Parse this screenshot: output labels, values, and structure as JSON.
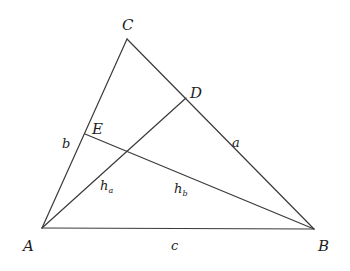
{
  "diagram": {
    "type": "triangle-altitudes",
    "points": {
      "A": {
        "label": "A",
        "x": 42,
        "y": 228
      },
      "B": {
        "label": "B",
        "x": 314,
        "y": 229
      },
      "C": {
        "label": "C",
        "x": 127,
        "y": 39
      },
      "D": {
        "label": "D",
        "x": 186,
        "y": 98
      },
      "E": {
        "label": "E",
        "x": 85,
        "y": 134
      }
    },
    "segments": [
      {
        "from": "A",
        "to": "B",
        "name": "side-c"
      },
      {
        "from": "B",
        "to": "C",
        "name": "side-a"
      },
      {
        "from": "C",
        "to": "A",
        "name": "side-b"
      },
      {
        "from": "A",
        "to": "D",
        "name": "altitude-ha"
      },
      {
        "from": "B",
        "to": "E",
        "name": "altitude-hb"
      }
    ],
    "side_labels": {
      "a": "a",
      "b": "b",
      "c": "c"
    },
    "altitude_labels": {
      "ha_main": "h",
      "ha_sub": "a",
      "hb_main": "h",
      "hb_sub": "b"
    },
    "colors": {
      "line": "#3a3a3a",
      "text": "#1e1e1e",
      "background": "#ffffff"
    }
  }
}
